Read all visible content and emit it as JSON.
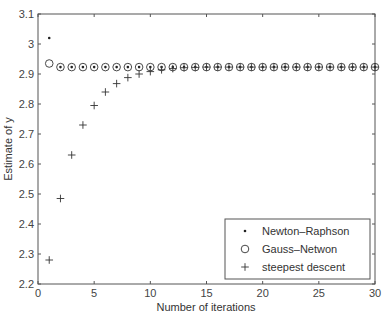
{
  "chart_data": {
    "type": "scatter",
    "title": "",
    "xlabel": "Number of iterations",
    "ylabel": "Estimate of y",
    "xlim": [
      0,
      30
    ],
    "ylim": [
      2.2,
      3.1
    ],
    "xticks": [
      0,
      5,
      10,
      15,
      20,
      25,
      30
    ],
    "yticks": [
      2.2,
      2.3,
      2.4,
      2.5,
      2.6,
      2.7,
      2.8,
      2.9,
      3,
      3.1
    ],
    "ytick_labels": [
      "2.2",
      "2.3",
      "2.4",
      "2.5",
      "2.6",
      "2.7",
      "2.8",
      "2.9",
      "3",
      "3.1"
    ],
    "grid": false,
    "legend_position": "lower right",
    "series": [
      {
        "name": "Newton–Raphson",
        "marker": "dot",
        "x": [
          1,
          2,
          3,
          4,
          5,
          6,
          7,
          8,
          9,
          10,
          11,
          12,
          13,
          14,
          15,
          16,
          17,
          18,
          19,
          20,
          21,
          22,
          23,
          24,
          25,
          26,
          27,
          28,
          29,
          30
        ],
        "values": [
          3.02,
          2.923,
          2.923,
          2.923,
          2.923,
          2.923,
          2.923,
          2.923,
          2.923,
          2.923,
          2.923,
          2.923,
          2.923,
          2.923,
          2.923,
          2.923,
          2.923,
          2.923,
          2.923,
          2.923,
          2.923,
          2.923,
          2.923,
          2.923,
          2.923,
          2.923,
          2.923,
          2.923,
          2.923,
          2.923
        ]
      },
      {
        "name": "Gauss–Netwon",
        "marker": "circle",
        "x": [
          1,
          2,
          3,
          4,
          5,
          6,
          7,
          8,
          9,
          10,
          11,
          12,
          13,
          14,
          15,
          16,
          17,
          18,
          19,
          20,
          21,
          22,
          23,
          24,
          25,
          26,
          27,
          28,
          29,
          30
        ],
        "values": [
          2.935,
          2.923,
          2.923,
          2.923,
          2.923,
          2.923,
          2.923,
          2.923,
          2.923,
          2.923,
          2.923,
          2.923,
          2.923,
          2.923,
          2.923,
          2.923,
          2.923,
          2.923,
          2.923,
          2.923,
          2.923,
          2.923,
          2.923,
          2.923,
          2.923,
          2.923,
          2.923,
          2.923,
          2.923,
          2.923
        ]
      },
      {
        "name": "steepest descent",
        "marker": "plus",
        "x": [
          1,
          2,
          3,
          4,
          5,
          6,
          7,
          8,
          9,
          10,
          11,
          12,
          13,
          14,
          15,
          16,
          17,
          18,
          19,
          20,
          21,
          22,
          23,
          24,
          25,
          26,
          27,
          28,
          29,
          30
        ],
        "values": [
          2.28,
          2.485,
          2.63,
          2.73,
          2.795,
          2.84,
          2.868,
          2.888,
          2.9,
          2.908,
          2.914,
          2.918,
          2.921,
          2.922,
          2.923,
          2.923,
          2.923,
          2.923,
          2.923,
          2.923,
          2.923,
          2.923,
          2.923,
          2.923,
          2.923,
          2.923,
          2.923,
          2.923,
          2.923,
          2.923
        ]
      }
    ]
  }
}
